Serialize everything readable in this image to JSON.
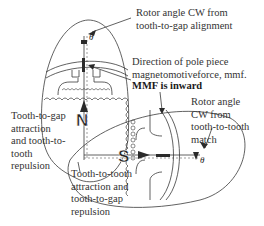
{
  "figure": {
    "type": "pole-piece torque diagram",
    "colors": {
      "line": "#3a3a3a",
      "text": "#333333",
      "background": "#ffffff"
    }
  },
  "labels": {
    "top_rotor_angle": "Rotor angle CW from\ntooth-to-gap alignment",
    "mmf_direction": "Direction of pole piece\nmagnetomotiveforce, mmf.",
    "mmf_inward": "MMF is inward",
    "right_rotor_angle": "Rotor angle\nCW from\ntooth-to-tooth\nmatch",
    "left_attraction": "Tooth-to-gap\nattraction\nand tooth-to-\ntooth\nrepulsion",
    "bottom_attraction": "Tooth-to-tooth\nattraction and\ntooth-to-gap\nrepulsion"
  },
  "symbols": {
    "north_pole": "N",
    "south_pole": "S",
    "angle_top": "θ",
    "angle_right": "θ"
  }
}
